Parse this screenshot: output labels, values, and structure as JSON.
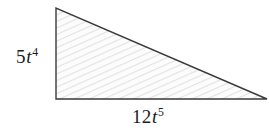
{
  "figure": {
    "type": "right-triangle-diagram",
    "background_color": "#ffffff",
    "shape": {
      "name": "right triangle",
      "stroke_color": "#3a3a3a",
      "stroke_width": 1.4,
      "fill_pattern": "diagonal-hatch",
      "fill_base_color": "#fcfcfc",
      "hatch_color": "#e2e2e2",
      "vertices": [
        {
          "label": "apex",
          "x": 56,
          "y": 8
        },
        {
          "label": "right-angle",
          "x": 56,
          "y": 99
        },
        {
          "label": "base-right",
          "x": 267,
          "y": 99
        }
      ]
    },
    "labels": {
      "height": {
        "coefficient": "5",
        "variable": "t",
        "exponent": "4",
        "plain": "5t^4",
        "position": "left-of-vertical-leg"
      },
      "base": {
        "coefficient": "12",
        "variable": "t",
        "exponent": "5",
        "plain": "12t^5",
        "position": "below-horizontal-leg"
      }
    }
  }
}
